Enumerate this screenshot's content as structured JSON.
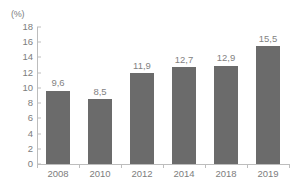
{
  "chart_data": {
    "type": "bar",
    "title": "",
    "subtitle": "",
    "xlabel": "",
    "ylabel": "",
    "unit_label": "(%)",
    "categories": [
      "2008",
      "2010",
      "2012",
      "2014",
      "2018",
      "2019"
    ],
    "values": [
      9.6,
      8.5,
      11.9,
      12.7,
      12.9,
      15.5
    ],
    "value_labels": [
      "9,6",
      "8,5",
      "11,9",
      "12,7",
      "12,9",
      "15,5"
    ],
    "ylim": [
      0,
      18
    ],
    "ytick_step": 2,
    "ytick_labels": [
      "0",
      "2",
      "4",
      "6",
      "8",
      "10",
      "12",
      "14",
      "16",
      "18"
    ],
    "ytick_values": [
      0,
      2,
      4,
      6,
      8,
      10,
      12,
      14,
      16,
      18
    ],
    "grid": false,
    "legend": false,
    "legend_position": "none",
    "decimal_separator": ",",
    "colors": {
      "bar_fill": "#6b6b6b",
      "axis_line": "#bdbdbd",
      "tick_text": "#7d7d7d",
      "value_text": "#828282",
      "background": "#ffffff"
    }
  }
}
